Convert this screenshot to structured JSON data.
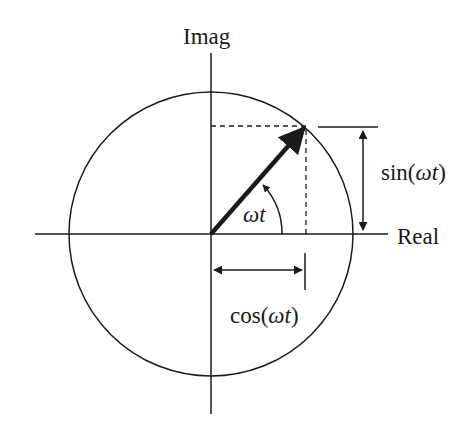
{
  "diagram": {
    "labels": {
      "imag_axis": "Imag",
      "real_axis": "Real",
      "angle": "ωt",
      "sin_label_prefix": "sin(",
      "sin_label_arg": "ωt",
      "sin_label_suffix": ")",
      "cos_label_prefix": "cos(",
      "cos_label_arg": "ωt",
      "cos_label_suffix": ")"
    },
    "colors": {
      "stroke": "#1a1a1a",
      "background": "#ffffff"
    }
  }
}
